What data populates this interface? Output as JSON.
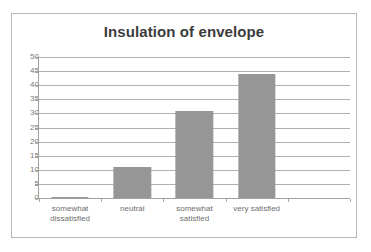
{
  "chart_data": {
    "type": "bar",
    "title": "Insulation of envelope",
    "xlabel": "",
    "ylabel": "",
    "categories": [
      "somewhat dissatisfied",
      "neutral",
      "somewhat satisfied",
      "very satisfied",
      ""
    ],
    "category_lines": [
      [
        "somewhat",
        "dissatisfied"
      ],
      [
        "neutral"
      ],
      [
        "somewhat",
        "satisfied"
      ],
      [
        "very satisfied"
      ],
      [
        ""
      ]
    ],
    "values": [
      0.5,
      11,
      31,
      44,
      null
    ],
    "ylim": [
      0,
      50
    ],
    "ytick_step": 5,
    "yticks": [
      0,
      5,
      10,
      15,
      20,
      25,
      30,
      35,
      40,
      45,
      50
    ],
    "ytick_labels": [
      "0",
      "5",
      "10",
      "15",
      "20",
      "25",
      "30",
      "35",
      "40",
      "45",
      "50"
    ],
    "grid": true,
    "legend": false,
    "bar_color": "#969696",
    "gridline_color": "#b0b0b0",
    "axis_color": "#a0a0a0",
    "title_color": "#3b3b3b",
    "tick_label_color": "#7b7b7b",
    "plot_background": "#ffffff",
    "border_color": "#b9b9b9"
  }
}
